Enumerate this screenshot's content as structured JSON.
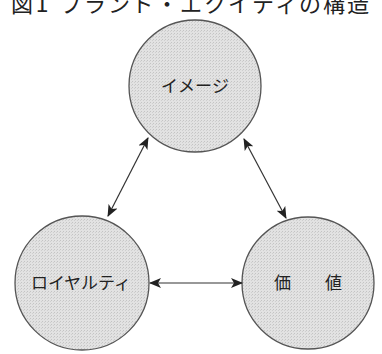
{
  "title": "図1 ブランド・エクイティの構造",
  "colors": {
    "circle_fill": "#dcdcdc",
    "circle_stroke": "#555555",
    "arrow": "#222222",
    "text": "#222222",
    "background": "#ffffff"
  },
  "nodes": [
    {
      "id": "image",
      "label": "イメージ",
      "cx": 195,
      "cy": 86,
      "r": 66
    },
    {
      "id": "loyalty",
      "label": "ロイヤルティ",
      "cx": 82,
      "cy": 283,
      "r": 67
    },
    {
      "id": "value",
      "label": "価　　値",
      "cx": 308,
      "cy": 283,
      "r": 66
    }
  ],
  "edges": [
    {
      "from": "image",
      "to": "loyalty",
      "bidirectional": true
    },
    {
      "from": "image",
      "to": "value",
      "bidirectional": true
    },
    {
      "from": "loyalty",
      "to": "value",
      "bidirectional": true
    }
  ]
}
